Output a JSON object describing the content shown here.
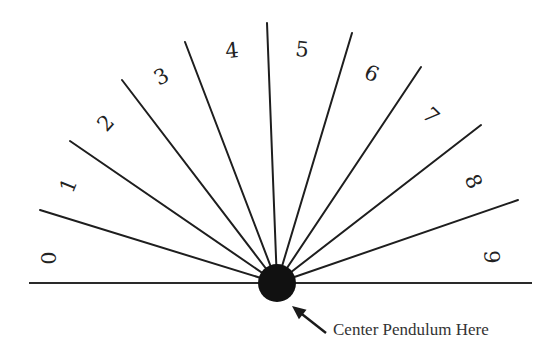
{
  "diagram": {
    "center": {
      "x": 277,
      "y": 283,
      "r": 19,
      "color": "#111111"
    },
    "baseline": {
      "x1": 29,
      "x2": 532,
      "y": 283
    },
    "rays": [
      {
        "x": 40,
        "y": 210
      },
      {
        "x": 70,
        "y": 141
      },
      {
        "x": 122,
        "y": 80
      },
      {
        "x": 185,
        "y": 42
      },
      {
        "x": 267,
        "y": 23
      },
      {
        "x": 352,
        "y": 33
      },
      {
        "x": 421,
        "y": 67
      },
      {
        "x": 481,
        "y": 125
      },
      {
        "x": 518,
        "y": 200
      }
    ],
    "labels": [
      {
        "text": "0",
        "x": 50,
        "y": 258,
        "rot": -90
      },
      {
        "text": "1",
        "x": 70,
        "y": 186,
        "rot": -68
      },
      {
        "text": "2",
        "x": 107,
        "y": 124,
        "rot": -48
      },
      {
        "text": "3",
        "x": 162,
        "y": 78,
        "rot": -28
      },
      {
        "text": "4",
        "x": 232,
        "y": 52,
        "rot": -6
      },
      {
        "text": "5",
        "x": 302,
        "y": 51,
        "rot": 6
      },
      {
        "text": "6",
        "x": 371,
        "y": 75,
        "rot": 24
      },
      {
        "text": "7",
        "x": 430,
        "y": 117,
        "rot": 44
      },
      {
        "text": "8",
        "x": 472,
        "y": 182,
        "rot": 66
      },
      {
        "text": "9",
        "x": 490,
        "y": 257,
        "rot": 88
      }
    ],
    "caption": "Center Pendulum Here",
    "arrow": {
      "from": {
        "x": 326,
        "y": 333
      },
      "to": {
        "x": 292,
        "y": 306
      }
    }
  }
}
